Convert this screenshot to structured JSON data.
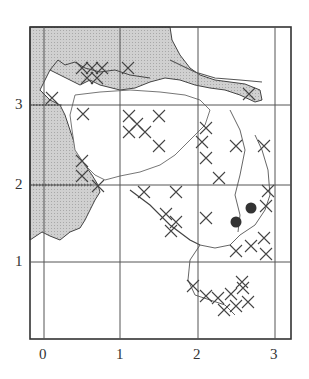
{
  "figure": {
    "type": "grid-distribution-map",
    "x_ticks": [
      {
        "label": "0",
        "x": 44
      },
      {
        "label": "1",
        "x": 120
      },
      {
        "label": "2",
        "x": 198
      },
      {
        "label": "3",
        "x": 275
      }
    ],
    "y_ticks": [
      {
        "label": "3",
        "y": 105
      },
      {
        "label": "2",
        "y": 185
      },
      {
        "label": "1",
        "y": 262
      }
    ],
    "frame": {
      "left": 30,
      "top": 27,
      "right": 291,
      "bottom": 339
    },
    "legend_symbols": {
      "cross": "x-mark records",
      "dot": "filled-circle records"
    },
    "dots": [
      {
        "x": 236,
        "y": 222
      },
      {
        "x": 251,
        "y": 208
      }
    ],
    "colors": {
      "sea": "#c8c8c8",
      "line": "#444444",
      "land": "#ffffff"
    }
  }
}
